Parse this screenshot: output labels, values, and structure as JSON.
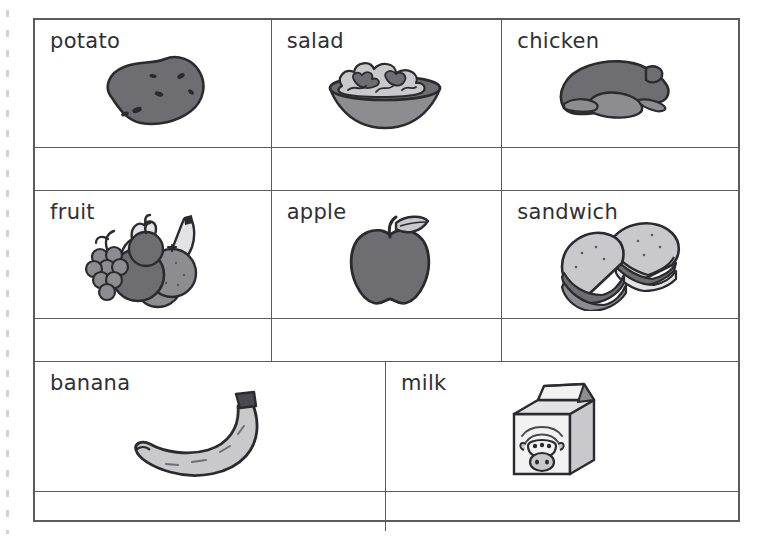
{
  "worksheet": {
    "type": "vocabulary-picture-grid",
    "title_text": "",
    "rows": [
      {
        "row_index": 1,
        "columns": 3,
        "cells": [
          {
            "label": "potato",
            "icon": "potato-illustration"
          },
          {
            "label": "salad",
            "icon": "salad-bowl-illustration"
          },
          {
            "label": "chicken",
            "icon": "roast-chicken-illustration"
          }
        ],
        "answer_row_cells": [
          "",
          "",
          ""
        ]
      },
      {
        "row_index": 2,
        "columns": 3,
        "cells": [
          {
            "label": "fruit",
            "icon": "mixed-fruit-illustration"
          },
          {
            "label": "apple",
            "icon": "apple-illustration"
          },
          {
            "label": "sandwich",
            "icon": "sandwich-halves-illustration"
          }
        ],
        "answer_row_cells": [
          "",
          "",
          ""
        ]
      },
      {
        "row_index": 3,
        "columns": 2,
        "cells": [
          {
            "label": "banana",
            "icon": "banana-illustration"
          },
          {
            "label": "milk",
            "icon": "milk-carton-illustration"
          }
        ],
        "answer_row_cells": [
          "",
          ""
        ]
      }
    ]
  },
  "colors": {
    "page_background": "#ffffff",
    "grid_line": "#5a5a5f",
    "text": "#2f2f33",
    "art_dark_gray": "#6e6e72",
    "art_mid_gray": "#8d8d91",
    "art_light_gray": "#c9c9cc",
    "art_pale_gray": "#e3e3e5",
    "art_outline": "#2b2b2f"
  }
}
